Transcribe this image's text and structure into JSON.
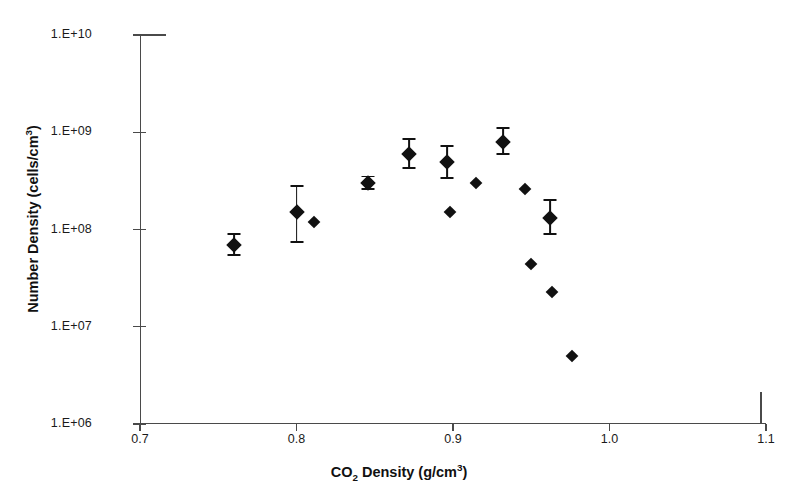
{
  "chart_data": {
    "type": "scatter",
    "title": "",
    "xlabel": "CO2 Density (g/cm3)",
    "ylabel": "Number Density (cells/cm3)",
    "xlabel_parts": {
      "pre": "CO",
      "sub": "2",
      "mid": " Density (g/cm",
      "sup": "3",
      "post": ")"
    },
    "ylabel_parts": {
      "pre": "Number Density (cells/cm",
      "sup": "3",
      "post": ")"
    },
    "xlim": [
      0.7,
      1.1
    ],
    "ylim": [
      1000000,
      10000000000
    ],
    "yscale": "log",
    "xticks": [
      0.7,
      0.8,
      0.9,
      1.0,
      1.1
    ],
    "xtick_labels": [
      "0.7",
      "0.8",
      "0.9",
      "1.0",
      "1.1"
    ],
    "yticks": [
      10000000000,
      1000000000,
      100000000,
      10000000,
      1000000
    ],
    "ytick_labels": [
      "1.E+10",
      "1.E+09",
      "1.E+08",
      "1.E+07",
      "1.E+06"
    ],
    "grid": false,
    "legend": "none",
    "marker": "filled-diamond",
    "marker_color": "#111111",
    "points": [
      {
        "x": 0.76,
        "y": 70000000.0,
        "yerr_low": 55000000.0,
        "yerr_high": 90000000.0
      },
      {
        "x": 0.8,
        "y": 150000000.0,
        "yerr_low": 75000000.0,
        "yerr_high": 280000000.0
      },
      {
        "x": 0.811,
        "y": 120000000.0,
        "yerr_low": null,
        "yerr_high": null
      },
      {
        "x": 0.846,
        "y": 300000000.0,
        "yerr_low": 260000000.0,
        "yerr_high": 350000000.0
      },
      {
        "x": 0.872,
        "y": 600000000.0,
        "yerr_low": 430000000.0,
        "yerr_high": 860000000.0
      },
      {
        "x": 0.896,
        "y": 500000000.0,
        "yerr_low": 340000000.0,
        "yerr_high": 720000000.0
      },
      {
        "x": 0.915,
        "y": 300000000.0,
        "yerr_low": null,
        "yerr_high": null
      },
      {
        "x": 0.898,
        "y": 150000000.0,
        "yerr_low": null,
        "yerr_high": null
      },
      {
        "x": 0.932,
        "y": 800000000.0,
        "yerr_low": 600000000.0,
        "yerr_high": 1100000000.0
      },
      {
        "x": 0.946,
        "y": 260000000.0,
        "yerr_low": null,
        "yerr_high": null
      },
      {
        "x": 0.962,
        "y": 130000000.0,
        "yerr_low": 90000000.0,
        "yerr_high": 200000000.0
      },
      {
        "x": 0.95,
        "y": 44000000.0,
        "yerr_low": null,
        "yerr_high": null
      },
      {
        "x": 0.963,
        "y": 23000000.0,
        "yerr_low": null,
        "yerr_high": null
      },
      {
        "x": 0.976,
        "y": 5000000.0,
        "yerr_low": null,
        "yerr_high": null
      }
    ]
  }
}
